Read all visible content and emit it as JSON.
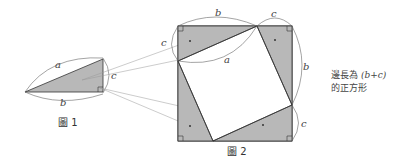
{
  "figure1": {
    "caption": "圖 1",
    "labels": {
      "a": "a",
      "b": "b",
      "c": "c"
    }
  },
  "figure2": {
    "caption": "圖 2",
    "labels": {
      "top_b": "b",
      "top_c": "c",
      "left_c": "c",
      "inner_a": "a",
      "right_b": "b",
      "right_c": "c"
    }
  },
  "annotation": {
    "line1_prefix": "邊長為 ",
    "line1_expr": "(b+c)",
    "line2": "的正方形"
  },
  "colors": {
    "triangle_fill": "#b8b8b8",
    "stroke": "#333333",
    "pointer": "#999999"
  }
}
